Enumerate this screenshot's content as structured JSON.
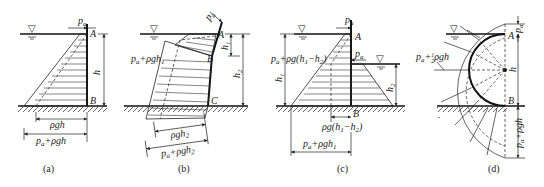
{
  "figure": {
    "panels": [
      {
        "id": "a",
        "caption": "(a)",
        "points": {
          "A": "A",
          "B": "B"
        },
        "labels": {
          "pa": "p",
          "pa_sub": "a",
          "h": "h",
          "rho_gh": "ρgh",
          "pa_plus": "p",
          "pa_plus_sub": "a",
          "pa_plus_rest": "+ρgh"
        }
      },
      {
        "id": "b",
        "caption": "(b)",
        "points": {
          "A": "A",
          "B": "B",
          "C": "C"
        },
        "labels": {
          "pa": "p",
          "pa_sub": "a",
          "h1": "h",
          "h1_sub": "1",
          "h2": "h",
          "h2_sub": "2",
          "left_label": "p",
          "left_label_sub": "a",
          "left_label_rest": "+ρgh",
          "left_label_rest_sub": "1",
          "rho_gh2": "ρgh",
          "rho_gh2_sub": "2",
          "pa_plus": "p",
          "pa_plus_sub": "a",
          "pa_plus_rest": "+ρgh",
          "pa_plus_rest_sub": "2"
        }
      },
      {
        "id": "c",
        "caption": "(c)",
        "points": {
          "A": "A",
          "B": "B"
        },
        "labels": {
          "pa_top": "p",
          "pa_top_sub": "a",
          "pa_right": "p",
          "pa_right_sub": "a",
          "left_label": "p",
          "left_label_sub": "a",
          "left_label_rest": "+ρg(h",
          "left_label_1": "1",
          "left_label_mid": "−h",
          "left_label_2": "2",
          "left_label_end": ")",
          "h1": "h",
          "h1_sub": "1",
          "h2": "h",
          "h2_sub": "2",
          "diff": "ρg(h",
          "diff_1": "1",
          "diff_mid": "−h",
          "diff_2": "2",
          "diff_end": ")",
          "total": "p",
          "total_sub": "a",
          "total_rest": "+ρgh",
          "total_rest_sub": "1"
        }
      },
      {
        "id": "d",
        "caption": "(d)",
        "points": {
          "A": "A",
          "B": "B"
        },
        "labels": {
          "pa": "p",
          "pa_sub": "a",
          "h": "h",
          "mid": "p",
          "mid_sub": "a",
          "mid_rest": "+",
          "mid_frac_num": "1",
          "mid_frac_den": "2",
          "mid_end": "ρgh",
          "bottom": "p",
          "bottom_sub": "a",
          "bottom_rest": "+ρgh"
        }
      }
    ],
    "water_surface_symbol": "▽"
  }
}
